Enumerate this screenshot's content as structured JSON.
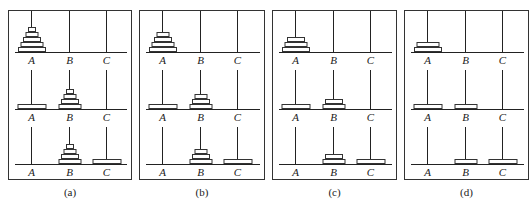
{
  "figure": {
    "peg_labels": [
      "A",
      "B",
      "C"
    ],
    "panels": [
      {
        "caption": "(a)",
        "n_disks": 5,
        "states": [
          {
            "A": [
              5,
              4,
              3,
              2,
              1
            ],
            "B": [],
            "C": []
          },
          {
            "A": [
              5
            ],
            "B": [
              4,
              3,
              2,
              1
            ],
            "C": []
          },
          {
            "A": [],
            "B": [
              4,
              3,
              2,
              1
            ],
            "C": [
              5
            ]
          }
        ]
      },
      {
        "caption": "(b)",
        "n_disks": 4,
        "states": [
          {
            "A": [
              4,
              3,
              2,
              1
            ],
            "B": [],
            "C": []
          },
          {
            "A": [
              4
            ],
            "B": [
              3,
              2,
              1
            ],
            "C": []
          },
          {
            "A": [],
            "B": [
              3,
              2,
              1
            ],
            "C": [
              4
            ]
          }
        ]
      },
      {
        "caption": "(c)",
        "n_disks": 3,
        "states": [
          {
            "A": [
              3,
              2,
              1
            ],
            "B": [],
            "C": []
          },
          {
            "A": [
              3
            ],
            "B": [
              2,
              1
            ],
            "C": []
          },
          {
            "A": [],
            "B": [
              2,
              1
            ],
            "C": [
              3
            ]
          }
        ]
      },
      {
        "caption": "(d)",
        "n_disks": 2,
        "states": [
          {
            "A": [
              2,
              1
            ],
            "B": [],
            "C": []
          },
          {
            "A": [
              2
            ],
            "B": [
              1
            ],
            "C": []
          },
          {
            "A": [],
            "B": [
              1
            ],
            "C": [
              2
            ]
          }
        ]
      }
    ]
  },
  "layout": {
    "panel_left": [
      8,
      139,
      272,
      404
    ],
    "panel_width": [
      124,
      126,
      125,
      125
    ],
    "peg_offsets": [
      22,
      60,
      97
    ],
    "base_y": [
      41,
      98,
      153
    ],
    "peg_top_y": [
      0,
      59,
      116
    ],
    "label_y": [
      43,
      100,
      155
    ],
    "disk_height": 5,
    "disk_widths": {
      "1": 8,
      "2": 13,
      "3": 18,
      "4": 23,
      "5": 28
    },
    "big_disk_width": 29
  }
}
